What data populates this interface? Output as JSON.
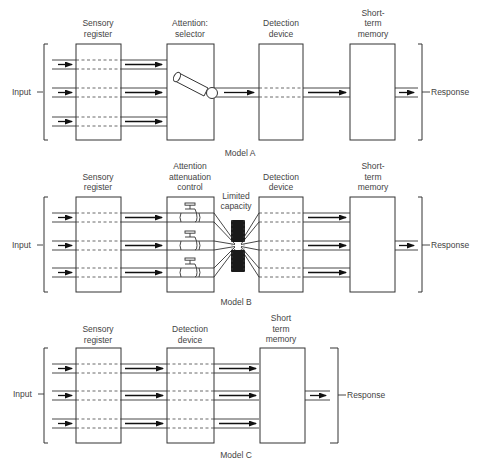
{
  "figure": {
    "models": [
      {
        "name": "Model A",
        "input_label": "Input",
        "response_label": "Response",
        "stages": [
          {
            "label_line1": "Sensory",
            "label_line2": "register",
            "label_line3": ""
          },
          {
            "label_line1": "Attention:",
            "label_line2": "selector",
            "label_line3": ""
          },
          {
            "label_line1": "Detection",
            "label_line2": "device",
            "label_line3": ""
          },
          {
            "label_line1": "Short-",
            "label_line2": "term",
            "label_line3": "memory"
          }
        ],
        "selector_icon": "switch-tube-icon"
      },
      {
        "name": "Model B",
        "input_label": "Input",
        "response_label": "Response",
        "stages": [
          {
            "label_line1": "Sensory",
            "label_line2": "register",
            "label_line3": ""
          },
          {
            "label_line1": "Attention",
            "label_line2": "attenuation",
            "label_line3": "control"
          },
          {
            "label_line1": "Detection",
            "label_line2": "device",
            "label_line3": ""
          },
          {
            "label_line1": "Short-",
            "label_line2": "term",
            "label_line3": "memory"
          }
        ],
        "bottleneck": {
          "label_line1": "Limited",
          "label_line2": "capacity"
        },
        "valve_icon": "valve-icon"
      },
      {
        "name": "Model C",
        "input_label": "Input",
        "response_label": "Response",
        "stages": [
          {
            "label_line1": "Sensory",
            "label_line2": "register",
            "label_line3": ""
          },
          {
            "label_line1": "Detection",
            "label_line2": "device",
            "label_line3": ""
          },
          {
            "label_line1": "Short",
            "label_line2": "term",
            "label_line3": "memory"
          }
        ]
      }
    ],
    "colors": {
      "line": "#333333",
      "arrow": "#111111",
      "text": "#444444",
      "bottleneck": "#1a1a1a"
    }
  }
}
